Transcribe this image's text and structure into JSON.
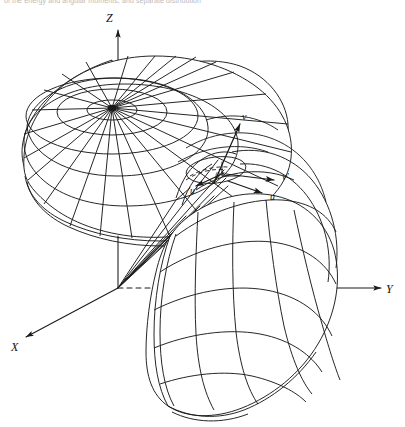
{
  "figure": {
    "kind": "3d-wireframe-line-drawing",
    "title_strip": "of the energy and angular moments, and separate distribution",
    "background_color": "#ffffff",
    "line_color": "#1a1a1a",
    "caption_color": "#b9b9bd"
  },
  "axes": {
    "origin": {
      "x": 118,
      "y": 288
    },
    "items": [
      {
        "id": "z",
        "label": "Z",
        "label_x": 106,
        "label_y": 22,
        "tip_x": 118,
        "tip_y": 26,
        "style": "solid-arrow"
      },
      {
        "id": "y",
        "label": "Y",
        "label_x": 388,
        "label_y": 292,
        "tip_x": 378,
        "tip_y": 288,
        "style": "solid-arrow"
      },
      {
        "id": "x",
        "label": "X",
        "label_x": 13,
        "label_y": 350,
        "tip_x": 22,
        "tip_y": 340,
        "style": "solid-arrow"
      }
    ],
    "dashed_segments": [
      {
        "id": "z-dashed-lower",
        "from": [
          118,
          108
        ],
        "to": [
          118,
          230
        ]
      },
      {
        "id": "y-dashed-inner",
        "from": [
          118,
          288
        ],
        "to": [
          300,
          288
        ]
      }
    ]
  },
  "vectors": [
    {
      "id": "v",
      "label": "v",
      "label_x": 243,
      "label_y": 119,
      "from": [
        222,
        168
      ],
      "to": [
        238,
        128
      ]
    },
    {
      "id": "v_prime",
      "label": "v′",
      "label_x": 286,
      "label_y": 179,
      "from": [
        226,
        173
      ],
      "to": [
        277,
        182
      ]
    },
    {
      "id": "u",
      "label": "u",
      "label_x": 273,
      "label_y": 199,
      "from": [
        230,
        181
      ],
      "to": [
        264,
        193
      ]
    },
    {
      "id": "u_prime",
      "label": "u′",
      "label_x": 197,
      "label_y": 192,
      "from": [
        224,
        172
      ],
      "to": [
        196,
        184
      ]
    }
  ],
  "angle_marker": {
    "id": "beta",
    "label": "β",
    "label_x": 219,
    "label_y": 177,
    "vertex": [
      222,
      170
    ]
  },
  "lobes": [
    {
      "id": "upper-polar-lobe",
      "description": "Upper dish-shaped lobe drawn as a polar mesh of radial spokes and concentric rings",
      "pole": [
        112,
        108
      ],
      "radial_spokes": 24,
      "concentric_rings": 5
    },
    {
      "id": "lower-right-lobe",
      "description": "Lower-right curved lobe drawn as a quadrilateral mesh of meridians and parallels",
      "meridians": 5,
      "parallels": 5
    },
    {
      "id": "origin-wedge",
      "description": "Narrow wedge of straight lines fanning out from the origin toward the vector cluster",
      "rays": 6
    }
  ]
}
